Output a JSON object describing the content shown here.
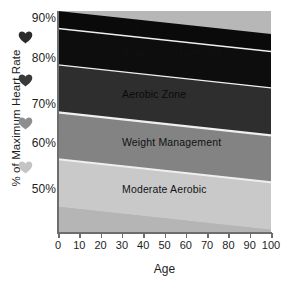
{
  "chart_data": {
    "type": "area",
    "title": "",
    "xlabel": "Age",
    "ylabel": "% of Maximum Heart Rate",
    "xlim": [
      0,
      100
    ],
    "ylim": [
      44,
      92
    ],
    "grid": false,
    "legend": "none",
    "x_ticks": [
      "0",
      "10",
      "20",
      "30",
      "40",
      "50",
      "60",
      "70",
      "80",
      "90",
      "100"
    ],
    "x_tick_values": [
      0,
      10,
      20,
      30,
      40,
      50,
      60,
      70,
      80,
      90,
      100
    ],
    "y_ticks": [
      "50%",
      "60%",
      "70%",
      "80%",
      "90%"
    ],
    "y_tick_values": [
      50,
      60,
      70,
      80,
      90
    ],
    "note": "Stacked training-zone bands decline linearly with age; each boundary drops about 5 percentage points from age 0 to age 100.",
    "bands": [
      {
        "name": "Red Line",
        "label": "Red Line",
        "label_visible": false,
        "color": "#0a0a0a",
        "text_color": "#141414",
        "y_top_at_age_0": 92,
        "y_top_at_age_100": 87,
        "y_bottom_at_age_0": 88.2,
        "y_bottom_at_age_100": 83.2
      },
      {
        "name": "Anaerobic Threshold",
        "label": "Anaerobic Threshold",
        "label_visible": false,
        "color": "#0d0d0d",
        "text_color": "#1a1a1a",
        "y_top_at_age_0": 88.2,
        "y_top_at_age_100": 83.2,
        "y_bottom_at_age_0": 80.3,
        "y_bottom_at_age_100": 75.3
      },
      {
        "name": "Aerobic Zone",
        "label": "Aerobic Zone",
        "label_visible": true,
        "color": "#2e2e2e",
        "text_color": "#0a0a0a",
        "y_top_at_age_0": 80.3,
        "y_top_at_age_100": 75.3,
        "y_bottom_at_age_0": 70.0,
        "y_bottom_at_age_100": 65.0
      },
      {
        "name": "Weight Management",
        "label": "Weight Management",
        "label_visible": true,
        "color": "#838383",
        "text_color": "#111111",
        "y_top_at_age_0": 70.0,
        "y_top_at_age_100": 65.0,
        "y_bottom_at_age_0": 59.8,
        "y_bottom_at_age_100": 54.8
      },
      {
        "name": "Moderate Aerobic",
        "label": "Moderate Aerobic",
        "label_visible": true,
        "color": "#c9c9c9",
        "text_color": "#141414",
        "y_top_at_age_0": 59.8,
        "y_top_at_age_100": 54.8,
        "y_bottom_at_age_0": 49.5,
        "y_bottom_at_age_100": 44.5
      },
      {
        "name": "Below Zone Background",
        "label": "",
        "label_visible": false,
        "color": "#b5b5b5",
        "text_color": "#141414",
        "y_top_at_age_0": 49.5,
        "y_top_at_age_100": 44.5,
        "y_bottom_at_age_0": 44,
        "y_bottom_at_age_100": 44
      }
    ],
    "separator_color": "#efefef",
    "axis_color": "#6d6d6d",
    "plot_background": "#b7b7b7"
  },
  "y_axis": {
    "title": "% of Maximum Heart Rate",
    "ticks": [
      {
        "label": "90%",
        "value": 90
      },
      {
        "label": "80%",
        "value": 80
      },
      {
        "label": "70%",
        "value": 70
      },
      {
        "label": "60%",
        "value": 60
      },
      {
        "label": "50%",
        "value": 50
      }
    ],
    "heart_icons": [
      {
        "name": "heart-icon-intensity-5",
        "color": "#2b2b2b",
        "between": "90-80"
      },
      {
        "name": "heart-icon-intensity-4",
        "color": "#3a3a3a",
        "between": "80-70"
      },
      {
        "name": "heart-icon-intensity-3",
        "color": "#8e8e8e",
        "between": "70-60"
      },
      {
        "name": "heart-icon-intensity-2",
        "color": "#c4c4c4",
        "between": "60-50"
      }
    ]
  },
  "x_axis": {
    "title": "Age",
    "ticks": [
      "0",
      "10",
      "20",
      "30",
      "40",
      "50",
      "60",
      "70",
      "80",
      "90",
      "100"
    ]
  }
}
